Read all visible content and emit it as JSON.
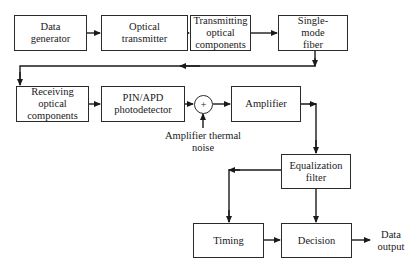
{
  "diagram": {
    "title": "",
    "blocks": {
      "data_generator": "Data\ngenerator",
      "optical_transmitter": "Optical\ntransmitter",
      "transmitting_optical_components": "Transmitting\noptical\ncomponents",
      "single_mode_fiber": "Single-\nmode\nfiber",
      "receiving_optical_components": "Receiving\noptical\ncomponents",
      "pin_apd_photodetector": "PIN/APD\nphotodetector",
      "amplifier": "Amplifier",
      "equalization_filter": "Equalization\nfilter",
      "timing": "Timing",
      "decision": "Decision"
    },
    "summing_junction": "+",
    "labels": {
      "amplifier_thermal_noise": "Amplifier thermal\nnoise",
      "data_output": "Data\noutput"
    },
    "connections": [
      [
        "data_generator",
        "optical_transmitter"
      ],
      [
        "optical_transmitter",
        "transmitting_optical_components"
      ],
      [
        "transmitting_optical_components",
        "single_mode_fiber"
      ],
      [
        "single_mode_fiber",
        "receiving_optical_components"
      ],
      [
        "receiving_optical_components",
        "pin_apd_photodetector"
      ],
      [
        "pin_apd_photodetector",
        "summing_junction"
      ],
      [
        "amplifier_thermal_noise",
        "summing_junction"
      ],
      [
        "summing_junction",
        "amplifier"
      ],
      [
        "amplifier",
        "equalization_filter"
      ],
      [
        "equalization_filter",
        "timing"
      ],
      [
        "equalization_filter",
        "decision"
      ],
      [
        "timing",
        "decision"
      ],
      [
        "decision",
        "data_output"
      ]
    ]
  }
}
